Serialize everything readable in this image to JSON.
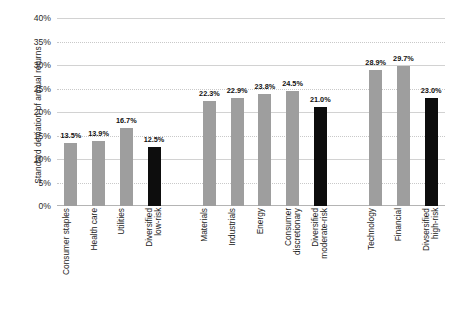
{
  "chart_data": {
    "type": "bar",
    "title": "",
    "xlabel": "",
    "ylabel": "Standard deviation of annual returns",
    "ylim": [
      0,
      40
    ],
    "ytick_labels": [
      "0%",
      "5%",
      "10%",
      "15%",
      "20%",
      "25%",
      "30%",
      "35%",
      "40%"
    ],
    "ytick_values": [
      0,
      5,
      10,
      15,
      20,
      25,
      30,
      35,
      40
    ],
    "grid": true,
    "legend": "none",
    "value_suffix": "%",
    "colors": {
      "sector_bar": "#9e9e9e",
      "diversified_bar": "#0d0d0d",
      "gridline": "#c9c9c9",
      "axis": "#b4b4b4",
      "text": "#1a1a1a"
    },
    "categories": [
      "Consumer staples",
      "Health care",
      "Utilities",
      "Diversified\nlow-risk",
      "",
      "Materials",
      "Industrials",
      "Energy",
      "Consumer\ndiscretionary",
      "Diversified\nmoderate-risk",
      "",
      "Technology",
      "Financial",
      "Divsersified\nhigh-risk"
    ],
    "values": [
      13.5,
      13.9,
      16.7,
      12.5,
      null,
      22.3,
      22.9,
      23.8,
      24.5,
      21.0,
      null,
      28.9,
      29.7,
      23.0
    ],
    "data_labels": [
      "13.5%",
      "13.9%",
      "16.7%",
      "12.5%",
      "",
      "22.3%",
      "22.9%",
      "23.8%",
      "24.5%",
      "21.0%",
      "",
      "28.9%",
      "29.7%",
      "23.0%"
    ],
    "bar_kinds": [
      "sector",
      "sector",
      "sector",
      "diversified",
      "spacer",
      "sector",
      "sector",
      "sector",
      "sector",
      "diversified",
      "spacer",
      "sector",
      "sector",
      "diversified"
    ]
  }
}
